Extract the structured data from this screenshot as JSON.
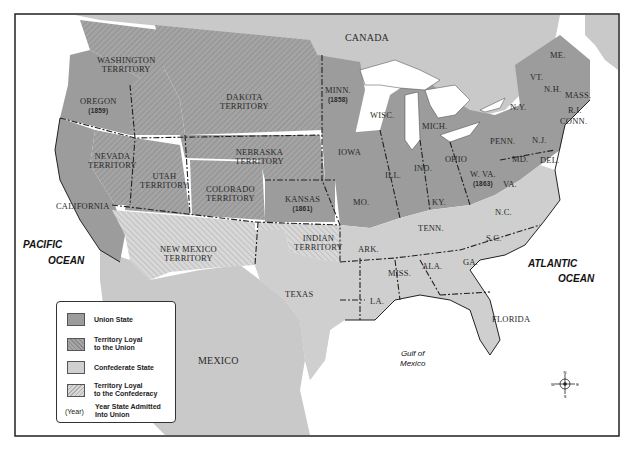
{
  "colors": {
    "union_state": "#9c9c9c",
    "territory_union": "#a8a8a8",
    "confederate_state": "#cfcfcf",
    "territory_confederacy": "#d6d6d6",
    "foreign_land": "#c9c9c9",
    "water": "#ffffff",
    "border": "#222222"
  },
  "labels": {
    "canada": "CANADA",
    "mexico": "MEXICO",
    "pacific1": "PACIFIC",
    "pacific2": "OCEAN",
    "atlantic1": "ATLANTIC",
    "atlantic2": "OCEAN",
    "gulf1": "Gulf of",
    "gulf2": "Mexico"
  },
  "regions": {
    "washington": [
      "WASHINGTON",
      "TERRITORY"
    ],
    "oregon": {
      "name": "OREGON",
      "year": "(1859)"
    },
    "dakota": [
      "DAKOTA",
      "TERRITORY"
    ],
    "nevada": [
      "NEVADA",
      "TERRITORY"
    ],
    "utah": [
      "UTAH",
      "TERRITORY"
    ],
    "nebraska": [
      "NEBRASKA",
      "TERRITORY"
    ],
    "colorado": [
      "COLORADO",
      "TERRITORY"
    ],
    "california": "CALIFORNIA",
    "kansas": {
      "name": "KANSAS",
      "year": "(1861)"
    },
    "minnesota": {
      "name": "MINN.",
      "year": "(1858)"
    },
    "new_mexico": [
      "NEW MEXICO",
      "TERRITORY"
    ],
    "indian": [
      "INDIAN",
      "TERRITORY"
    ],
    "texas": "TEXAS",
    "iowa": "IOWA",
    "wisconsin": "WISC.",
    "michigan": "MICH.",
    "illinois": "ILL.",
    "indiana": "IND.",
    "ohio": "OHIO",
    "missouri": "MO.",
    "kentucky": "KY.",
    "west_virginia": {
      "name": "W. VA.",
      "year": "(1863)"
    },
    "virginia": "VA.",
    "pennsylvania": "PENN.",
    "new_york": "N.Y.",
    "new_jersey": "N.J.",
    "maryland": "MD.",
    "delaware": "DEL.",
    "maine": "ME.",
    "vermont": "VT.",
    "new_hampshire": "N.H.",
    "massachusetts": "MASS.",
    "rhode_island": "R.I.",
    "connecticut": "CONN.",
    "north_carolina": "N.C.",
    "south_carolina": "S.C.",
    "tennessee": "TENN.",
    "arkansas": "ARK.",
    "mississippi": "MISS.",
    "alabama": "ALA.",
    "georgia": "GA.",
    "louisiana": "LA.",
    "florida": "FLORIDA"
  },
  "legend": {
    "items": [
      {
        "label": "Union State",
        "type": "union_state"
      },
      {
        "label1": "Territory Loyal",
        "label2": "to the Union",
        "type": "territory_union"
      },
      {
        "label": "Confederate State",
        "type": "confederate_state"
      },
      {
        "label1": "Territory Loyal",
        "label2": "to the Confederacy",
        "type": "territory_confederacy"
      }
    ],
    "year_marker": "(Year)",
    "year_text1": "Year State Admitted",
    "year_text2": "Into Union"
  },
  "compass": {
    "n": "N",
    "s": "S",
    "e": "E",
    "w": "W"
  }
}
